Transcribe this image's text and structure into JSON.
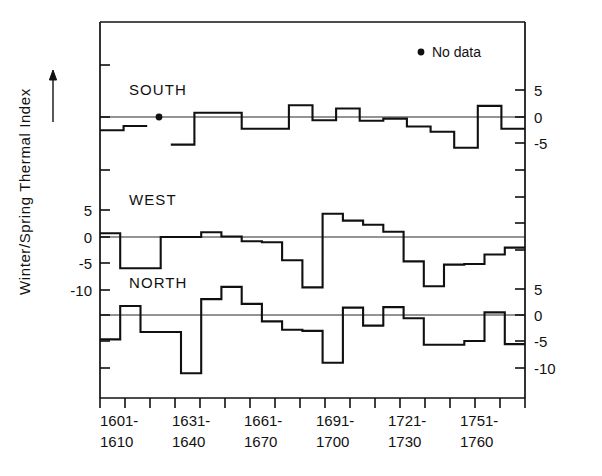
{
  "chart_data": {
    "type": "line",
    "title": "",
    "subtitle": "",
    "xlabel": "",
    "ylabel": "Winter/Spring Thermal Index",
    "grid": false,
    "legend_position": "top-right",
    "legend": [
      {
        "marker": "dot",
        "label": "No data"
      }
    ],
    "annotations": [
      {
        "kind": "axis-arrow",
        "label": "up-arrow",
        "note": "arrow beside y-axis title indicating increasing index"
      },
      {
        "kind": "no-data-marker",
        "series": "SOUTH",
        "x_index": 2,
        "label": "No data"
      }
    ],
    "x_tick_labels_top": [
      "1601-",
      "1631-",
      "1661-",
      "1691-",
      "1721-",
      "1751-"
    ],
    "x_tick_labels_bottom": [
      "1610",
      "1640",
      "1670",
      "1700",
      "1730",
      "1760"
    ],
    "categories": [
      "1601-1610",
      "1611-1620",
      "1621-1630",
      "1631-1640",
      "1641-1650",
      "1651-1660",
      "1661-1670",
      "1671-1680",
      "1681-1690",
      "1691-1700",
      "1701-1710",
      "1711-1720",
      "1721-1730",
      "1731-1740",
      "1741-1750",
      "1751-1760",
      "1761-1770"
    ],
    "n_decades": 17,
    "panels": [
      {
        "name": "SOUTH",
        "label": "SOUTH",
        "axis_side": "right",
        "ylim": [
          -8,
          7
        ],
        "yticks": [
          5,
          0,
          -5
        ],
        "ytick_labels": [
          "5",
          "0",
          "-5"
        ],
        "values": [
          -2.5,
          -1.7,
          null,
          -5.2,
          0.8,
          0.8,
          -2.2,
          -2.2,
          2.2,
          -0.6,
          1.6,
          -0.7,
          -0.3,
          -1.8,
          -2.8,
          -5.8,
          2.1,
          -2.2
        ]
      },
      {
        "name": "WEST",
        "label": "WEST",
        "axis_side": "left",
        "ylim": [
          -12,
          7
        ],
        "yticks": [
          5,
          0,
          -5,
          -10
        ],
        "ytick_labels": [
          "5",
          "0",
          "-5",
          "-10"
        ],
        "values": [
          0.7,
          -5.9,
          -5.9,
          0.0,
          0.0,
          0.9,
          0.1,
          -0.8,
          -1.0,
          -4.4,
          -9.5,
          4.4,
          3.1,
          2.3,
          1.0,
          -4.6,
          -9.3,
          -5.2,
          -5.1,
          -3.3,
          -2.0
        ]
      },
      {
        "name": "NORTH",
        "label": "NORTH",
        "axis_side": "right",
        "ylim": [
          -13,
          7
        ],
        "yticks": [
          5,
          0,
          -5,
          -10
        ],
        "ytick_labels": [
          "5",
          "0",
          "-5",
          "-10"
        ],
        "values": [
          -4.6,
          1.7,
          -3.2,
          -3.2,
          -11.0,
          3.0,
          5.3,
          2.1,
          -1.2,
          -2.8,
          -3.0,
          -9.0,
          1.4,
          -2.0,
          1.5,
          -0.6,
          -5.6,
          -5.6,
          -4.9,
          0.5,
          -5.5
        ]
      }
    ]
  },
  "figure": {
    "ylabel": "Winter/Spring Thermal Index",
    "legend_label": "No data",
    "panel_labels": {
      "south": "SOUTH",
      "west": "WEST",
      "north": "NORTH"
    },
    "left_axis_ticks": [
      "5",
      "0",
      "-5",
      "-10"
    ],
    "right_axis_top_ticks": [
      "5",
      "0",
      "-5"
    ],
    "right_axis_bottom_ticks": [
      "5",
      "0",
      "-5",
      "-10"
    ],
    "x_labels": [
      {
        "top": "1601-",
        "bottom": "1610"
      },
      {
        "top": "1631-",
        "bottom": "1640"
      },
      {
        "top": "1661-",
        "bottom": "1670"
      },
      {
        "top": "1691-",
        "bottom": "1700"
      },
      {
        "top": "1721-",
        "bottom": "1730"
      },
      {
        "top": "1751-",
        "bottom": "1760"
      }
    ],
    "colors": {
      "ink": "#101010",
      "background": "#ffffff"
    }
  }
}
